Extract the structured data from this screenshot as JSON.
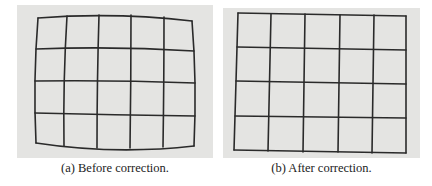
{
  "figure": {
    "panels": [
      {
        "id": "a",
        "caption": "(a) Before correction.",
        "description": "Photographed checkerboard grid with barrel distortion",
        "grid": {
          "columns": 5,
          "rows": 4
        }
      },
      {
        "id": "b",
        "caption": "(b) After correction.",
        "description": "Same grid after distortion correction, straight lines",
        "grid": {
          "columns": 5,
          "rows": 4
        }
      }
    ],
    "colors": {
      "background": "#e4e4e2",
      "grid_line": "#2a2a2a",
      "caption_text": "#222222"
    }
  }
}
